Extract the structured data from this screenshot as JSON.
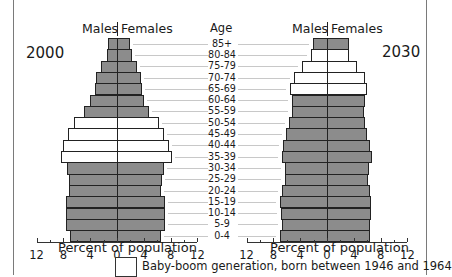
{
  "chart_data": [
    {
      "type": "bar",
      "orientation": "horizontal-population-pyramid",
      "title": "2000",
      "header_left": "Males",
      "header_right": "Females",
      "xlabel": "Percent of population",
      "ylabel": "Age",
      "xlim": [
        -12,
        12
      ],
      "xticks": [
        12,
        8,
        4,
        0,
        4,
        8,
        12
      ],
      "categories": [
        "85+",
        "80-84",
        "75-79",
        "70-74",
        "65-69",
        "60-64",
        "55-59",
        "50-54",
        "45-49",
        "40-44",
        "35-39",
        "30-34",
        "25-29",
        "20-24",
        "15-19",
        "10-14",
        "5-9",
        "0-4"
      ],
      "series": [
        {
          "name": "Males",
          "values": [
            1.3,
            1.5,
            2.4,
            3.1,
            3.3,
            4.0,
            4.9,
            6.4,
            7.3,
            8.0,
            8.4,
            7.5,
            7.2,
            7.2,
            7.6,
            7.6,
            7.6,
            7.0
          ]
        },
        {
          "name": "Females",
          "values": [
            1.8,
            2.1,
            2.8,
            3.4,
            3.6,
            3.9,
            4.6,
            6.1,
            6.9,
            7.6,
            8.0,
            6.9,
            6.6,
            6.4,
            7.0,
            7.0,
            7.0,
            6.4
          ]
        }
      ],
      "baby_boom": [
        false,
        false,
        false,
        false,
        false,
        false,
        false,
        true,
        true,
        true,
        true,
        false,
        false,
        false,
        false,
        false,
        false,
        false
      ]
    },
    {
      "type": "bar",
      "orientation": "horizontal-population-pyramid",
      "title": "2030",
      "header_left": "Males",
      "header_right": "Females",
      "xlabel": "Percent of population",
      "ylabel": "Age",
      "xlim": [
        -12,
        12
      ],
      "xticks": [
        12,
        8,
        4,
        0,
        4,
        8,
        12
      ],
      "categories": [
        "85+",
        "80-84",
        "75-79",
        "70-74",
        "65-69",
        "60-64",
        "55-59",
        "50-54",
        "45-49",
        "40-44",
        "35-39",
        "30-34",
        "25-29",
        "20-24",
        "15-19",
        "10-14",
        "5-9",
        "0-4"
      ],
      "series": [
        {
          "name": "Males",
          "values": [
            2.1,
            2.4,
            3.7,
            4.9,
            5.5,
            5.2,
            5.2,
            5.7,
            6.1,
            6.6,
            6.7,
            6.3,
            6.3,
            6.7,
            7.0,
            6.9,
            6.7,
            7.0
          ]
        },
        {
          "name": "Females",
          "values": [
            3.1,
            3.1,
            4.3,
            5.5,
            5.8,
            5.5,
            5.4,
            5.5,
            5.8,
            6.3,
            6.6,
            6.1,
            6.0,
            6.3,
            6.4,
            6.4,
            6.3,
            6.3
          ]
        }
      ],
      "baby_boom": [
        false,
        true,
        true,
        true,
        true,
        false,
        false,
        false,
        false,
        false,
        false,
        false,
        false,
        false,
        false,
        false,
        false,
        false
      ]
    }
  ],
  "labels": {
    "age_title": "Age",
    "males": "Males",
    "females": "Females",
    "left_year": "2000",
    "right_year": "2030",
    "xlabel": "Percent of population",
    "tick_labels": [
      "12",
      "8",
      "4",
      "0",
      "4",
      "8",
      "12"
    ]
  },
  "legend": {
    "text": "Baby-boom generation, born between 1946 and 1964",
    "swatch_color": "#ffffff"
  },
  "colors": {
    "bar_fill": "#8c8c8c",
    "boom_fill": "#ffffff",
    "outline": "#222222",
    "guide": "#c8c8c8"
  }
}
